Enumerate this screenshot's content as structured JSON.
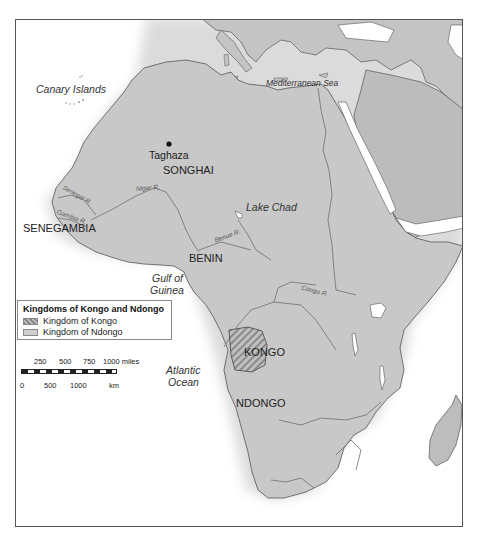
{
  "map": {
    "labels": {
      "water": {
        "canary_islands": "Canary Islands",
        "mediterranean_sea": "Mediterranean Sea",
        "lake_chad": "Lake Chad",
        "gulf_of_guinea_line1": "Gulf of",
        "gulf_of_guinea_line2": "Guinea",
        "atlantic_ocean_line1": "Atlantic",
        "atlantic_ocean_line2": "Ocean"
      },
      "kingdoms": {
        "songhai": "SONGHAI",
        "senegambia": "SENEGAMBIA",
        "benin": "BENIN",
        "kongo": "KONGO",
        "ndongo": "NDONGO"
      },
      "cities": {
        "taghaza": "Taghaza"
      },
      "rivers": {
        "senegal": "Senegal R.",
        "gambia": "Gambia R.",
        "niger": "Niger R.",
        "benue": "Benue R.",
        "congo": "Congo R."
      }
    },
    "legend": {
      "title": "Kingdoms of Kongo and Ndongo",
      "items": [
        {
          "label": "Kingdom of Kongo",
          "swatch": "hatched-gray"
        },
        {
          "label": "Kingdom of Ndongo",
          "swatch": "solid-light-gray"
        }
      ]
    },
    "scale": {
      "miles_ticks": [
        "250",
        "500",
        "750",
        "1000 miles"
      ],
      "km_ticks": [
        "0",
        "500",
        "1000",
        "km"
      ]
    },
    "colors": {
      "land": "#c8c8c8",
      "relief": "#bdbdbd",
      "water": "#ffffff",
      "coast": "#555555",
      "river": "#6e6e6e",
      "kongo_hatch": "#8a8a8a",
      "border": "#555555"
    }
  }
}
